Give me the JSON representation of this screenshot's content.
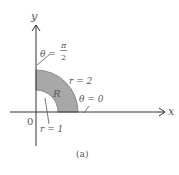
{
  "figure": {
    "caption": "(a)",
    "region_label": "R",
    "region_fill": "#a8a8a8",
    "region_stroke": "#8a8a8a",
    "axis_color": "#333333",
    "text_color": "#555555"
  },
  "axes": {
    "x_label": "x",
    "y_label": "y",
    "origin_label": "0"
  },
  "annotations": {
    "theta_top_lhs": "θ =",
    "theta_top_num": "π",
    "theta_top_den": "2",
    "theta_right": "θ = 0",
    "r_outer": "r = 2",
    "r_inner": "r = 1"
  }
}
